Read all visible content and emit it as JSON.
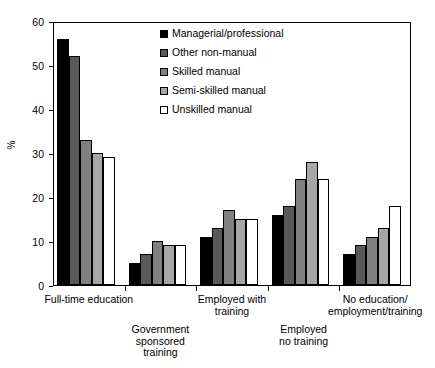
{
  "chart_data": {
    "type": "bar",
    "title": "",
    "xlabel": "",
    "ylabel": "%",
    "ylim": [
      0,
      60
    ],
    "yticks": [
      0,
      10,
      20,
      30,
      40,
      50,
      60
    ],
    "grid": false,
    "legend_position": "top-center-inside",
    "categories": [
      "Full-time education",
      "Government\nsponsored\ntraining",
      "Employed with\ntraining",
      "Employed\nno training",
      "No education/\nemployment/training"
    ],
    "series": [
      {
        "name": "Managerial/professional",
        "color": "#000000",
        "values": [
          56,
          5,
          11,
          16,
          7
        ]
      },
      {
        "name": "Other non-manual",
        "color": "#595959",
        "values": [
          52,
          7,
          13,
          18,
          9
        ]
      },
      {
        "name": "Skilled manual",
        "color": "#808080",
        "values": [
          33,
          10,
          17,
          24,
          11
        ]
      },
      {
        "name": "Semi-skilled manual",
        "color": "#a6a6a6",
        "values": [
          30,
          9,
          15,
          28,
          13
        ]
      },
      {
        "name": "Unskilled manual",
        "color": "#ffffff",
        "values": [
          29,
          9,
          15,
          24,
          18
        ]
      }
    ]
  }
}
